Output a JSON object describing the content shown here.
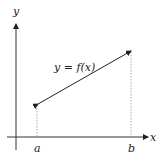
{
  "diagram": {
    "axes": {
      "x_label": "x",
      "y_label": "y"
    },
    "curve_label": "y = f(x)",
    "points": {
      "a_label": "a",
      "b_label": "b"
    },
    "colors": {
      "line": "#222222",
      "guide": "#999999"
    }
  }
}
